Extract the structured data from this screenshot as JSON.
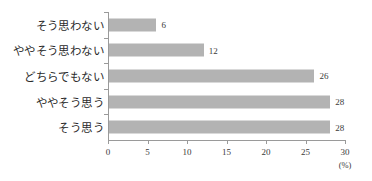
{
  "chart_data": {
    "type": "bar",
    "orientation": "horizontal",
    "title": "",
    "xlabel": "(%)",
    "ylabel": "",
    "xlim": [
      0,
      30
    ],
    "xticks": [
      "0",
      "5",
      "10",
      "15",
      "20",
      "25",
      "30"
    ],
    "grid": false,
    "legend": false,
    "bar_color": "#b3b3b3",
    "axis_color": "#9a9a9a",
    "categories": [
      "そう思わない",
      "ややそう思わない",
      "どちらでもない",
      "ややそう思う",
      "そう思う"
    ],
    "values": [
      6,
      12,
      26,
      28,
      28
    ],
    "value_labels": [
      "6",
      "12",
      "26",
      "28",
      "28"
    ]
  }
}
